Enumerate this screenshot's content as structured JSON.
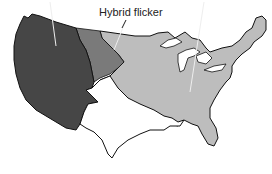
{
  "map": {
    "labels": {
      "hybrid": "Hybrid flicker"
    },
    "regions": [
      {
        "name": "western-firefly-region",
        "color": "#464646"
      },
      {
        "name": "hybrid-flicker-region",
        "color": "#7a7a7a"
      },
      {
        "name": "eastern-region",
        "color": "#bdbdbd"
      },
      {
        "name": "southwest-unshaded-region",
        "color": "#ffffff"
      }
    ],
    "outline_color": "#111111"
  }
}
